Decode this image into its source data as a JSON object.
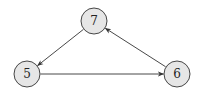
{
  "diagram": {
    "type": "directed-graph",
    "node_fill": "#e6e6e6",
    "node_stroke": "#333333",
    "edge_color": "#333333",
    "nodes": [
      {
        "id": "7",
        "label": "7",
        "x": 94,
        "y": 21,
        "r": 13
      },
      {
        "id": "5",
        "label": "5",
        "x": 27,
        "y": 74,
        "r": 13
      },
      {
        "id": "6",
        "label": "6",
        "x": 177,
        "y": 74,
        "r": 13
      }
    ],
    "edges": [
      {
        "from": "7",
        "to": "5"
      },
      {
        "from": "5",
        "to": "6"
      },
      {
        "from": "6",
        "to": "7"
      }
    ]
  }
}
